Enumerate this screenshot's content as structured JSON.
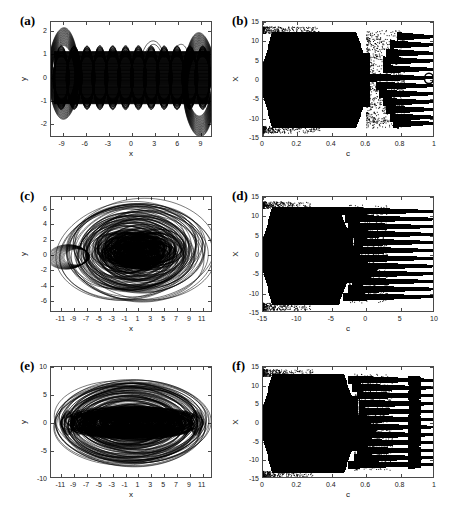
{
  "figure": {
    "background": "#ffffff",
    "ink": "#000000",
    "axis_color": "#4a4a4a",
    "width": 458,
    "height": 517
  },
  "panels": [
    {
      "id": "a",
      "label": "(a)",
      "kind": "phase-portrait",
      "xlabel": "x",
      "ylabel": "y",
      "xlim": [
        -10.5,
        10.5
      ],
      "ylim": [
        -2.6,
        2.4
      ],
      "xticks": [
        -9,
        -6,
        -3,
        0,
        3,
        6,
        9
      ],
      "yticks": [
        -2,
        -1,
        0,
        1,
        2
      ],
      "xticklabels": [
        "-9",
        "-6",
        "-3",
        "0",
        "3",
        "6",
        "9"
      ],
      "yticklabels": [
        "-2",
        "-1",
        "0",
        "1",
        "2"
      ]
    },
    {
      "id": "b",
      "label": "(b)",
      "kind": "bifurcation",
      "xlabel": "c",
      "ylabel": "X",
      "xlim": [
        0,
        1
      ],
      "ylim": [
        -15,
        15
      ],
      "xticks": [
        0,
        0.2,
        0.4,
        0.6,
        0.8,
        1
      ],
      "yticks": [
        -15,
        -10,
        -5,
        0,
        5,
        10,
        15
      ],
      "xticklabels": [
        "0",
        "0.2",
        "0.4",
        "0.6",
        "0.8",
        "1"
      ],
      "yticklabels": [
        "-15",
        "-10",
        "-5",
        "0",
        "5",
        "10",
        "15"
      ],
      "chaos_end": 0.6,
      "band_levels": [
        11.3,
        9.2,
        7.0,
        5.0,
        2.8,
        0.6,
        -1.5,
        -3.6,
        -5.7,
        -7.7,
        -9.7,
        -11.3
      ]
    },
    {
      "id": "c",
      "label": "(c)",
      "kind": "phase-portrait",
      "xlabel": "x",
      "ylabel": "y",
      "xlim": [
        -12.6,
        12.6
      ],
      "ylim": [
        -7.6,
        7.6
      ],
      "xticks": [
        -11,
        -9,
        -7,
        -5,
        -3,
        -1,
        1,
        3,
        5,
        7,
        9,
        11
      ],
      "yticks": [
        -6,
        -4,
        -2,
        0,
        2,
        4,
        6
      ],
      "xticklabels": [
        "-11",
        "-9",
        "-7",
        "-5",
        "-3",
        "-1",
        "1",
        "3",
        "5",
        "7",
        "9",
        "11"
      ],
      "yticklabels": [
        "-6",
        "-4",
        "-2",
        "0",
        "2",
        "4",
        "6"
      ]
    },
    {
      "id": "d",
      "label": "(d)",
      "kind": "bifurcation",
      "xlabel": "c",
      "ylabel": "X",
      "xlim": [
        0,
        1
      ],
      "ylim": [
        -15,
        15
      ],
      "xticks": [
        0,
        0.2,
        0.4,
        0.6,
        0.8,
        1
      ],
      "yticks": [
        -15,
        -10,
        -5,
        0,
        5,
        10,
        15
      ],
      "xticklabels": [
        "-15",
        "-10",
        "-5",
        "0",
        "5",
        "10",
        "15"
      ],
      "yticklabels": [
        "-15",
        "-10",
        "-5",
        "0",
        "5",
        "10",
        "15"
      ],
      "chaos_end": 0.5,
      "band_levels": [
        11.4,
        9.4,
        7.4,
        5.4,
        3.3,
        1.2,
        -0.9,
        -2.9,
        -4.9,
        -6.9,
        -8.9,
        -10.9
      ]
    },
    {
      "id": "e",
      "label": "(e)",
      "kind": "phase-portrait",
      "xlabel": "x",
      "ylabel": "y",
      "xlim": [
        -12.6,
        12.6
      ],
      "ylim": [
        -10,
        10
      ],
      "xticks": [
        -11,
        -9,
        -7,
        -5,
        -3,
        -1,
        1,
        3,
        5,
        7,
        9,
        11
      ],
      "yticks": [
        -10,
        -5,
        0,
        5,
        10
      ],
      "xticklabels": [
        "-11",
        "-9",
        "-7",
        "-5",
        "-3",
        "-1",
        "1",
        "3",
        "5",
        "7",
        "9",
        "11"
      ],
      "yticklabels": [
        "-10",
        "-5",
        "0",
        "5",
        "10"
      ]
    },
    {
      "id": "f",
      "label": "(f)",
      "kind": "bifurcation",
      "xlabel": "c",
      "ylabel": "X",
      "xlim": [
        0,
        1
      ],
      "ylim": [
        -15,
        15
      ],
      "xticks": [
        0,
        0.2,
        0.4,
        0.6,
        0.8,
        1
      ],
      "yticks": [
        -15,
        -10,
        -5,
        0,
        5,
        10,
        15
      ],
      "xticklabels": [
        "0",
        "0.2",
        "0.4",
        "0.6",
        "0.8",
        "1"
      ],
      "yticklabels": [
        "-15",
        "-10",
        "-5",
        "0",
        "5",
        "10",
        "15"
      ],
      "chaos_end": 0.53,
      "band_levels": [
        11.6,
        9.5,
        7.4,
        5.2,
        3.1,
        1.0,
        -1.1,
        -3.2,
        -5.3,
        -7.4,
        -9.4,
        -11.2
      ]
    }
  ],
  "chart_data": [
    {
      "type": "line",
      "panel": "a",
      "title": "(a) phase portrait - corrugated periodic band attractor",
      "xlabel": "x",
      "ylabel": "y",
      "xlim": [
        -10.5,
        10.5
      ],
      "ylim": [
        -2.6,
        2.4
      ],
      "xticks": [
        -9,
        -6,
        -3,
        0,
        3,
        6,
        9
      ],
      "yticks": [
        -2,
        -1,
        0,
        1,
        2
      ],
      "grid": false,
      "legend": "none",
      "description": "Dense band of overlapping near-elliptical loops between y=-1.35 and y=1.35 across x=-10 to 10, with scalloped upper and lower envelopes (about 12 lobes). Larger nested loops at the left end (x from -10 to -8, y up to 1.9) and at the right end (x from 6 to 10, y down to -2.4).",
      "envelope_upper": 1.35,
      "envelope_lower": -1.35,
      "lobe_count": 12,
      "series": [
        {
          "name": "main-band",
          "x_range": [
            -10,
            10
          ],
          "y_range": [
            -1.35,
            1.35
          ]
        },
        {
          "name": "left-bulge",
          "x_range": [
            -10.2,
            -7.5
          ],
          "y_range": [
            -1.6,
            1.95
          ]
        },
        {
          "name": "right-bulge",
          "x_range": [
            5.8,
            10.3
          ],
          "y_range": [
            -2.45,
            1.55
          ]
        }
      ]
    },
    {
      "type": "scatter",
      "panel": "b",
      "title": "(b) bifurcation diagram X vs c",
      "xlabel": "c",
      "ylabel": "X",
      "xlim": [
        0,
        1
      ],
      "ylim": [
        -15,
        15
      ],
      "xticks": [
        0,
        0.2,
        0.4,
        0.6,
        0.8,
        1
      ],
      "yticks": [
        -15,
        -10,
        -5,
        0,
        5,
        10,
        15
      ],
      "grid": false,
      "legend": "none",
      "description": "Solid chaotic band filling X from about -12.5 to 12.5 for c below 0.60, tapering near c=0 to about -13..12.5. Beyond c=0.60 the attractor breaks into roughly 12 horizontal periodic branches that extend to c=1; a small open loop sits near X=0 close to c=0.97.",
      "chaos_region": [
        0.0,
        0.6
      ],
      "chaos_amplitude": [
        -12.5,
        12.5
      ],
      "band_levels": [
        11.3,
        9.2,
        7.0,
        5.0,
        2.8,
        0.6,
        -1.5,
        -3.6,
        -5.7,
        -7.7,
        -9.7,
        -11.3
      ],
      "band_start_c": [
        0.78,
        0.74,
        0.72,
        0.7,
        0.7,
        0.6,
        0.66,
        0.68,
        0.7,
        0.72,
        0.74,
        0.76
      ]
    },
    {
      "type": "line",
      "panel": "c",
      "title": "(c) phase portrait - chaotic attractor",
      "xlabel": "x",
      "ylabel": "y",
      "xlim": [
        -12.6,
        12.6
      ],
      "ylim": [
        -7.6,
        7.6
      ],
      "xticks": [
        -11,
        -9,
        -7,
        -5,
        -3,
        -1,
        1,
        3,
        5,
        7,
        9,
        11
      ],
      "yticks": [
        -6,
        -4,
        -2,
        0,
        2,
        4,
        6
      ],
      "grid": false,
      "legend": "none",
      "description": "Sparse chaotic trajectory: many large overlapping elliptical orbits spanning x from -11.5 to 12 and y from -7 to 7, with a dense dark core of small loops centred near x=0, y=0.5 occupying x=-6..8, y=-2..2.5. A distinctive hook of loops protrudes to the left near x=-11, y=0.",
      "outer_extent": {
        "x": [
          -11.8,
          12.2
        ],
        "y": [
          -7.2,
          7.0
        ]
      },
      "core_extent": {
        "x": [
          -6.5,
          8.0
        ],
        "y": [
          -2.3,
          2.6
        ]
      }
    },
    {
      "type": "scatter",
      "panel": "d",
      "title": "(d) bifurcation diagram X vs c",
      "xlabel": "c",
      "ylabel": "X",
      "xlim": [
        0,
        1
      ],
      "ylim": [
        -15,
        15
      ],
      "xticks": [
        0,
        0.2,
        0.4,
        0.6,
        0.8,
        1
      ],
      "yticks": [
        -15,
        -10,
        -5,
        0,
        5,
        10,
        15
      ],
      "grid": false,
      "legend": "none",
      "description": "Solid chaotic band filling X from about -13 to 12.5 for c below 0.50, with a narrow spray of scattered points near c=0.02 reaching -14 and 13. Beyond c=0.50 twelve near-horizontal periodic branches run to c=1, slightly converging.",
      "chaos_region": [
        0.0,
        0.5
      ],
      "chaos_amplitude": [
        -13.0,
        12.5
      ],
      "band_levels": [
        11.4,
        9.4,
        7.4,
        5.4,
        3.3,
        1.2,
        -0.9,
        -2.9,
        -4.9,
        -6.9,
        -8.9,
        -10.9
      ],
      "band_start_c": [
        0.45,
        0.48,
        0.5,
        0.52,
        0.53,
        0.52,
        0.52,
        0.52,
        0.52,
        0.52,
        0.5,
        0.47
      ]
    },
    {
      "type": "line",
      "panel": "e",
      "title": "(e) phase portrait - dense chaotic attractor",
      "xlabel": "x",
      "ylabel": "y",
      "xlim": [
        -12.6,
        12.6
      ],
      "ylim": [
        -10,
        10
      ],
      "xticks": [
        -11,
        -9,
        -7,
        -5,
        -3,
        -1,
        1,
        3,
        5,
        7,
        9,
        11
      ],
      "yticks": [
        -10,
        -5,
        0,
        5,
        10
      ],
      "grid": false,
      "legend": "none",
      "description": "Dense lens-shaped chaotic attractor: a very dark solid core of small loops along y=0 spanning x=-10 to 10 and y=-2.5 to 2.5, surrounded by progressively sparser large ellipses reaching x=-12 to 12 and y=-8 to 7.5.",
      "outer_extent": {
        "x": [
          -12.2,
          12.2
        ],
        "y": [
          -8.2,
          7.6
        ]
      },
      "core_extent": {
        "x": [
          -10.0,
          10.0
        ],
        "y": [
          -2.6,
          2.6
        ]
      }
    },
    {
      "type": "scatter",
      "panel": "f",
      "title": "(f) bifurcation diagram X vs c",
      "xlabel": "c",
      "ylabel": "X",
      "xlim": [
        0,
        1
      ],
      "ylim": [
        -15,
        15
      ],
      "xticks": [
        0,
        0.2,
        0.4,
        0.6,
        0.8,
        1
      ],
      "yticks": [
        -15,
        -10,
        -5,
        0,
        5,
        10,
        15
      ],
      "grid": false,
      "legend": "none",
      "description": "Solid chaotic band filling X from about -13.5 to 13 for c below 0.53, with scattered stray points along the left edge near c=0.03. Beyond c=0.53 about twelve horizontal periodic branches continue to c=1, showing a local disturbance near c=0.88.",
      "chaos_region": [
        0.0,
        0.53
      ],
      "chaos_amplitude": [
        -13.5,
        13.0
      ],
      "band_levels": [
        11.6,
        9.5,
        7.4,
        5.2,
        3.1,
        1.0,
        -1.1,
        -3.2,
        -5.3,
        -7.4,
        -9.4,
        -11.2
      ],
      "band_start_c": [
        0.5,
        0.52,
        0.55,
        0.56,
        0.56,
        0.55,
        0.55,
        0.55,
        0.55,
        0.55,
        0.53,
        0.5
      ],
      "disturbance_c": 0.88
    }
  ]
}
